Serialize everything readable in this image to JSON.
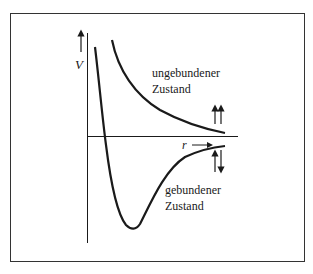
{
  "diagram": {
    "y_axis_label": "V",
    "x_axis_label": "r",
    "unbound_state": {
      "label_line1": "ungebundener",
      "label_line2": "Zustand",
      "spin_arrows": "↑↑"
    },
    "bound_state": {
      "label_line1": "gebundener",
      "label_line2": "Zustand",
      "spin_arrows": "↑↓"
    },
    "colors": {
      "line": "#1a1a1a",
      "frame": "#333333",
      "background": "#ffffff"
    }
  }
}
